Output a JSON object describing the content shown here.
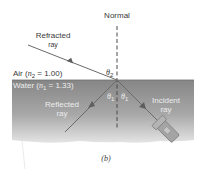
{
  "figure": {
    "caption": "(b)",
    "normal_label": "Normal",
    "refracted_label": [
      "Refracted",
      "ray"
    ],
    "reflected_label": [
      "Reflected",
      "ray"
    ],
    "incident_label": [
      "Incident",
      "ray"
    ],
    "air": {
      "medium": "Air",
      "symbol": "n",
      "subscript": "2",
      "value": "= 1.00"
    },
    "water": {
      "medium": "Water",
      "symbol": "n",
      "subscript": "1",
      "value": "= 1.33"
    },
    "angles": {
      "theta2": {
        "symbol": "θ",
        "subscript": "2"
      },
      "theta1_left": {
        "symbol": "θ",
        "subscript": "1"
      },
      "theta1_right": {
        "symbol": "θ",
        "subscript": "1"
      }
    }
  },
  "colors": {
    "water_top": "#8a8a8a",
    "water_bottom": "#c8c8c8",
    "ray": "#6a6a6a",
    "text": "#3a3a3a",
    "flashlight": "#9a9a9a"
  }
}
